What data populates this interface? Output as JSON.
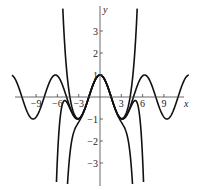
{
  "chart_data": {
    "type": "line",
    "title": "",
    "xlabel": "x",
    "ylabel": "y",
    "xlim": [
      -13.2,
      12.6
    ],
    "ylim": [
      -4.0,
      4.05
    ],
    "grid": false,
    "legend": "none",
    "x_ticks": [
      -9,
      -6,
      -3,
      3,
      6,
      9
    ],
    "x_tick_labels": [
      "−9",
      "−6",
      "−3",
      "3",
      "6",
      "9"
    ],
    "y_ticks": [
      3,
      2,
      1,
      -1,
      -2,
      -3
    ],
    "y_tick_labels": [
      "3",
      "2",
      "1",
      "−1",
      "−2",
      "−3"
    ],
    "series": [
      {
        "name": "cos x",
        "kind": "cos",
        "domain": [
          -12.4,
          12.5
        ]
      },
      {
        "name": "T6 (Taylor degree 6 of cos x)",
        "kind": "taylor",
        "degree": 6,
        "domain": [
          -4.8,
          4.8
        ]
      },
      {
        "name": "T8 (Taylor degree 8 of cos x)",
        "kind": "taylor",
        "degree": 8,
        "domain": [
          -5.4,
          5.4
        ]
      },
      {
        "name": "T10 (Taylor degree 10 of cos x)",
        "kind": "taylor",
        "degree": 10,
        "domain": [
          -6.3,
          6.3
        ]
      }
    ],
    "colors": {
      "curve": "#111111",
      "axis": "#444444",
      "text": "#222222"
    }
  }
}
